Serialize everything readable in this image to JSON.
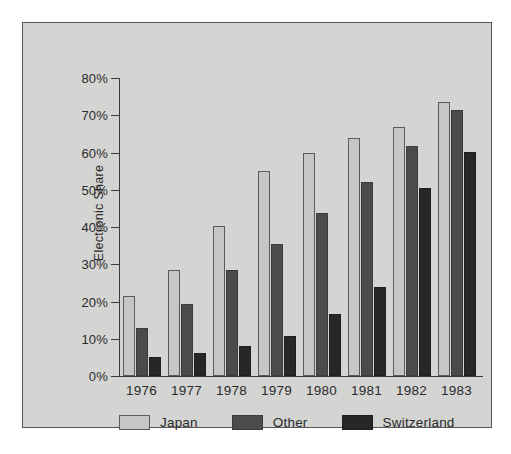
{
  "chart_data": {
    "type": "bar",
    "title": "",
    "xlabel": "",
    "ylabel": "Electronic Share",
    "categories": [
      "1976",
      "1977",
      "1978",
      "1979",
      "1980",
      "1981",
      "1982",
      "1983"
    ],
    "series": [
      {
        "name": "Japan",
        "color": "#c6c6c4",
        "values": [
          21.5,
          28.5,
          40.3,
          55.0,
          59.8,
          63.8,
          66.8,
          73.5
        ]
      },
      {
        "name": "Other",
        "color": "#4b4b4b",
        "values": [
          12.8,
          19.2,
          28.4,
          35.4,
          43.8,
          52.2,
          61.7,
          71.3
        ]
      },
      {
        "name": "Switzerland",
        "color": "#272727",
        "values": [
          5.0,
          6.3,
          8.0,
          10.8,
          16.7,
          23.9,
          50.6,
          60.2
        ]
      }
    ],
    "ylim": [
      0,
      80
    ],
    "yticks": [
      0,
      10,
      20,
      30,
      40,
      50,
      60,
      70,
      80
    ],
    "ytick_labels": [
      "0%",
      "10%",
      "20%",
      "30%",
      "40%",
      "50%",
      "60%",
      "70%",
      "80%"
    ],
    "grid": false,
    "legend_position": "bottom-left",
    "legend_entries": [
      "Japan",
      "Other",
      "Switzerland"
    ]
  },
  "axis": {
    "y_title": "Electronic Share"
  },
  "colors": {
    "panel_background": "#d4d4d2",
    "panel_border": "#575757",
    "axis": "#3a3a3a",
    "text": "#2b2b2b",
    "japan": "#c6c6c4",
    "other": "#4b4b4b",
    "switzerland": "#272727"
  }
}
